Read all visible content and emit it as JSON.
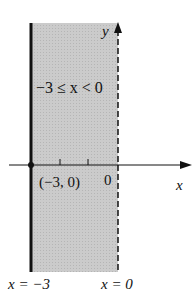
{
  "figure": {
    "region_label": "−3 ≤ x < 0",
    "point_label": "(−3, 0)",
    "origin_label": "0",
    "x_axis_label": "x",
    "y_axis_label": "y",
    "left_boundary_label": "x = −3",
    "right_boundary_label": "x = 0",
    "colors": {
      "shade": "#c8c8c8",
      "line": "#111111"
    }
  }
}
